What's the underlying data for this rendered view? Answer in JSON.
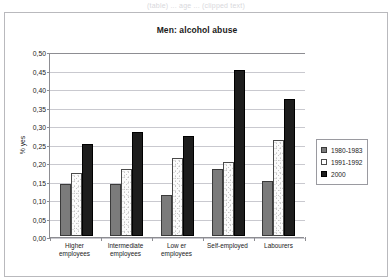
{
  "top_caption": "(table) ... age ... (clipped text)",
  "chart_data": {
    "type": "bar",
    "title": "Men: alcohol abuse",
    "xlabel": "",
    "ylabel": "% yes",
    "ylim": [
      0,
      0.5
    ],
    "ytick_labels": [
      "0,50",
      "0,45",
      "0,40",
      "0,35",
      "0,30",
      "0,25",
      "0,20",
      "0,15",
      "0,10",
      "0,05",
      "0,00"
    ],
    "ytick_values": [
      0.5,
      0.45,
      0.4,
      0.35,
      0.3,
      0.25,
      0.2,
      0.15,
      0.1,
      0.05,
      0.0
    ],
    "grid": true,
    "legend_position": "right",
    "categories": [
      "Higher employees",
      "Intermediate employees",
      "Low er employees",
      "Self-employed",
      "Labourers"
    ],
    "series": [
      {
        "name": "1980-1983",
        "color": "#7b7b7b",
        "values": [
          0.14,
          0.14,
          0.11,
          0.18,
          0.15
        ]
      },
      {
        "name": "1991-1992",
        "color": "#ffffff",
        "values": [
          0.17,
          0.18,
          0.21,
          0.2,
          0.26
        ]
      },
      {
        "name": "2000",
        "color": "#1d1d1d",
        "values": [
          0.25,
          0.28,
          0.27,
          0.45,
          0.37
        ]
      }
    ]
  }
}
